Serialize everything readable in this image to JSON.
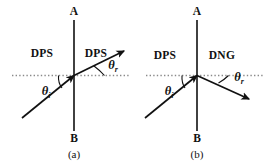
{
  "figure": {
    "type": "optics-refraction-diagram",
    "background_color": "#ffffff",
    "stroke_color": "#111111",
    "normal_line_color": "#8a8a8a",
    "panels": [
      {
        "id": "a",
        "caption": "(a)",
        "interface_top_label": "A",
        "interface_bottom_label": "B",
        "left_medium_label": "DPS",
        "right_medium_label": "DPS",
        "incident_angle_symbol": "θ",
        "incident_angle_subscript": "i",
        "refracted_angle_symbol": "θ",
        "refracted_angle_subscript": "r",
        "description": "Positive refraction: ray crosses the interface and continues upward to the right, staying on the opposite side of the normal."
      },
      {
        "id": "b",
        "caption": "(b)",
        "interface_top_label": "A",
        "interface_bottom_label": "B",
        "left_medium_label": "DPS",
        "right_medium_label": "DNG",
        "incident_angle_symbol": "θ",
        "incident_angle_subscript": "i",
        "refracted_angle_symbol": "θ",
        "refracted_angle_subscript": "r",
        "description": "Negative refraction: ray crosses the interface and bends downward to the right, onto the same side of the normal as the incident ray."
      }
    ]
  }
}
